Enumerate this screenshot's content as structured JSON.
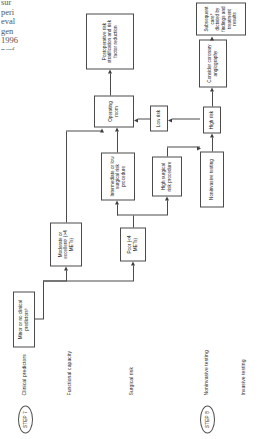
{
  "figure": {
    "orientation": "rotated-90-ccw",
    "title_fragments": {
      "lines": [
        "sur",
        "peri",
        "eval",
        "gen",
        "1996",
        "perf"
      ]
    }
  },
  "steps": [
    {
      "id": "step7",
      "label": "STEP 7"
    },
    {
      "id": "step8",
      "label": "STEP 8"
    }
  ],
  "row_labels": [
    {
      "id": "clinical-predictors",
      "label": "Clinical predictors"
    },
    {
      "id": "functional-capacity",
      "label": "Functional capacity"
    },
    {
      "id": "surgical-risk",
      "label": "Surgical risk"
    },
    {
      "id": "noninvasive-testing",
      "label": "Noninvasive testing"
    },
    {
      "id": "invasive-testing",
      "label": "Invasive testing"
    }
  ],
  "nodes": {
    "minor": "Minor or no clinical predictorsᵇ",
    "moderate": "Moderate or excellentᶜ (>4 METs)",
    "poor": "Poor (<4 METs)",
    "intermediate_low": "Intermediate or low surgical risk procedure",
    "high_risk_proc": "High surgical risk procedure",
    "operating_room": "Operating room",
    "postoperative": "Postoperative risk stratification and risk factor reduction",
    "noninvasive_testing": "Noninvasive testing",
    "low_risk": "Low risk",
    "high_risk": "High risk",
    "consider_angio": "Consider coronary angiography",
    "subsequent_care": "Subsequent care* dictated by findings and treatment results"
  },
  "colors": {
    "line": "#4a4a4a",
    "text": "#171717",
    "background": "#ffffff"
  }
}
